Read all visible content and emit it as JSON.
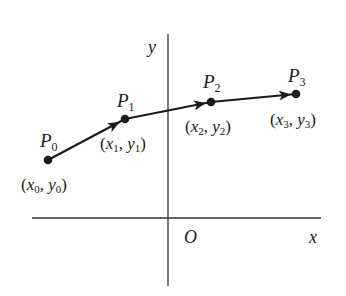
{
  "diagram": {
    "axes": {
      "x_label": "x",
      "y_label": "y",
      "origin_label": "O"
    },
    "points": [
      {
        "name": "P",
        "index": "0",
        "coord_x": "x",
        "coord_y": "y",
        "sub": "0"
      },
      {
        "name": "P",
        "index": "1",
        "coord_x": "x",
        "coord_y": "y",
        "sub": "1"
      },
      {
        "name": "P",
        "index": "2",
        "coord_x": "x",
        "coord_y": "y",
        "sub": "2"
      },
      {
        "name": "P",
        "index": "3",
        "coord_x": "x",
        "coord_y": "y",
        "sub": "3"
      }
    ],
    "punct": {
      "open": "(",
      "comma": ", ",
      "close": ")"
    },
    "colors": {
      "stroke": "#1a1a1a",
      "axis": "#333333",
      "background": "#ffffff"
    }
  }
}
